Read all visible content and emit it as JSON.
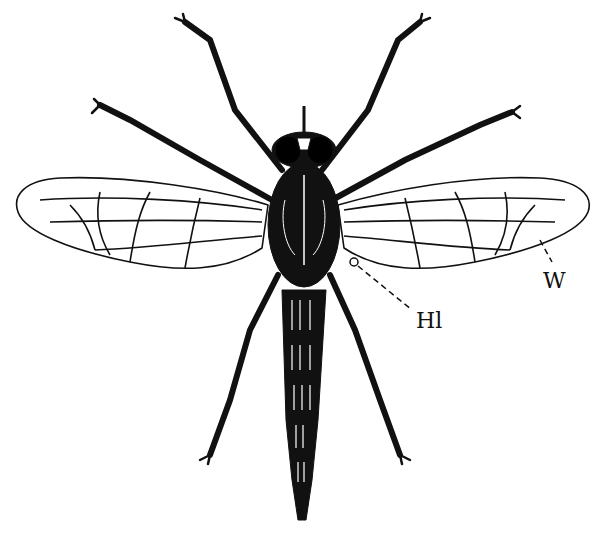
{
  "figure": {
    "labels": [
      {
        "id": "halter",
        "text": "Hl",
        "x": 418,
        "y": 330
      },
      {
        "id": "wing",
        "text": "W",
        "x": 546,
        "y": 288
      }
    ]
  },
  "colors": {
    "ink": "#111111",
    "paper": "#ffffff"
  }
}
